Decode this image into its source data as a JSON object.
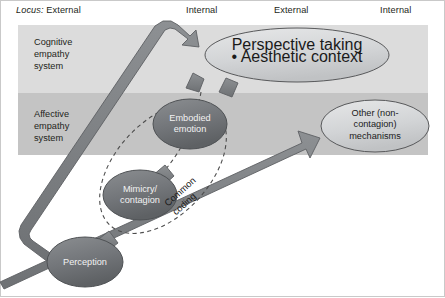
{
  "figure": {
    "locus_prefix": "Locus:",
    "locus_labels": [
      {
        "text": "External",
        "x": 40,
        "y": 10
      },
      {
        "text": "Internal",
        "x": 186,
        "y": 10
      },
      {
        "text": "External",
        "x": 274,
        "y": 10
      },
      {
        "text": "Internal",
        "x": 380,
        "y": 10
      }
    ],
    "bands": [
      {
        "name": "cognitive-empathy-system",
        "label_lines": [
          "Cognitive",
          "empathy",
          "system"
        ],
        "color": "#dcdcdc"
      },
      {
        "name": "affective-empathy-system",
        "label_lines": [
          "Affective",
          "empathy",
          "system"
        ],
        "color": "#c4c4c4"
      }
    ],
    "nodes": [
      {
        "name": "perspective-taking",
        "title": "Perspective taking",
        "bullet": "• Aesthetic context"
      },
      {
        "name": "other-mechanisms",
        "lines": [
          "Other (non-",
          "contagion)",
          "mechanisms"
        ]
      },
      {
        "name": "embodied-emotion",
        "lines": [
          "Embodied",
          "emotion"
        ]
      },
      {
        "name": "mimicry-contagion",
        "lines": [
          "Mimicry/",
          "contagion"
        ]
      },
      {
        "name": "perception",
        "lines": [
          "Perception"
        ]
      }
    ],
    "annotations": [
      {
        "name": "common-coding",
        "lines": [
          "Common",
          "coding"
        ]
      }
    ],
    "colors": {
      "band_cognitive": "#dcdcdc",
      "band_affective": "#c4c4c4",
      "arrow_fill": "#7d7f82",
      "arrow_stroke": "#5f6164",
      "ellipse_dark": "#6e7174",
      "ellipse_light": "#cfd1d3",
      "dashed_stroke": "#4d4d4d",
      "frame": "#b9b9b9",
      "text": "#231f20"
    }
  }
}
